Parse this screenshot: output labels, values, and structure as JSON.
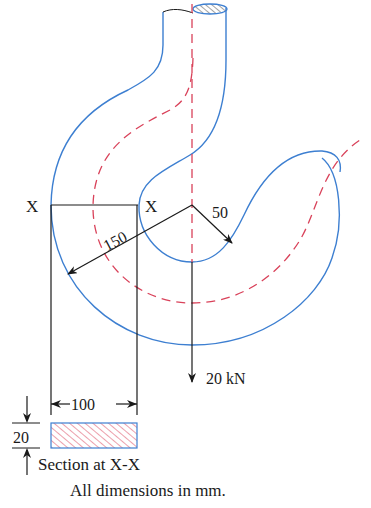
{
  "figure": {
    "type": "crane-hook-curved-beam",
    "colors": {
      "outline": "#3d7fd1",
      "centroidal_axis": "#d9425a",
      "dimension": "#1a1a1a",
      "hatch": "#d9425a"
    }
  },
  "labels": {
    "section_mark_left": "X",
    "section_mark_right": "X",
    "inner_radius": "50",
    "outer_radius": "150",
    "load": "20 kN",
    "section_width": "100",
    "section_depth": "20",
    "section_caption": "Section at X-X",
    "units_note": "All dimensions in mm."
  }
}
